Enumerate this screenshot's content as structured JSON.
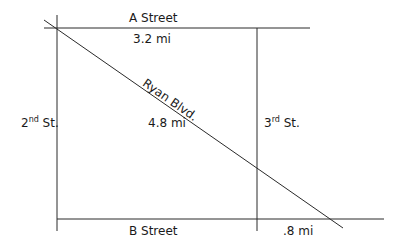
{
  "diagram": {
    "type": "street-map",
    "colors": {
      "line": "#2a2a2a",
      "text": "#1a1a1a",
      "background": "#ffffff"
    },
    "streets": [
      {
        "id": "a-street",
        "label": "A Street",
        "orientation": "horizontal"
      },
      {
        "id": "b-street",
        "label": "B Street",
        "orientation": "horizontal"
      },
      {
        "id": "second-st",
        "label_base": "2",
        "label_sup": "nd",
        "label_tail": " St.",
        "orientation": "vertical"
      },
      {
        "id": "third-st",
        "label_base": "3",
        "label_sup": "rd",
        "label_tail": " St.",
        "orientation": "vertical"
      },
      {
        "id": "ryan-blvd",
        "label": "Ryan Blvd.",
        "orientation": "diagonal"
      }
    ],
    "distances": {
      "a_street": "3.2 mi",
      "ryan_blvd": "4.8 mi",
      "b_street_extension": ".8 mi"
    }
  }
}
